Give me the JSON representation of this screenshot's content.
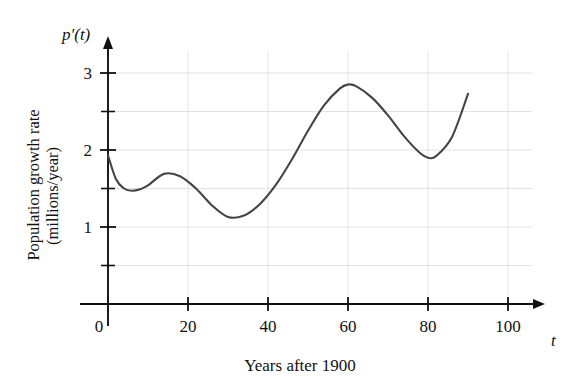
{
  "chart_data": {
    "type": "line",
    "title": "",
    "subtitle": "",
    "xlabel": "Years after 1900",
    "ylabel": "Population growth rate (millions/year)",
    "ylabel_line1": "Population growth rate",
    "ylabel_line2": "(millions/year)",
    "x_axis_symbol": "t",
    "y_axis_symbol": "p′(t)",
    "xlim": [
      0,
      108
    ],
    "ylim": [
      0,
      3.35
    ],
    "x_major_ticks": [
      0,
      20,
      40,
      60,
      80,
      100
    ],
    "x_tick_labels": [
      "0",
      "20",
      "40",
      "60",
      "80",
      "100"
    ],
    "y_major_ticks": [
      1,
      2,
      3
    ],
    "y_tick_labels": [
      "1",
      "2",
      "3"
    ],
    "y_minor_ticks": [
      0.5,
      1.5,
      2.5
    ],
    "grid": true,
    "grid_color": "#e2e2e6",
    "legend": "none",
    "line_color": "#444448",
    "axis_color": "#111111",
    "series": [
      {
        "name": "p'(t)",
        "x": [
          0,
          2,
          4,
          6,
          8,
          10,
          14,
          18,
          22,
          26,
          30,
          34,
          38,
          42,
          46,
          50,
          54,
          58,
          60,
          62,
          66,
          70,
          74,
          78,
          80,
          82,
          86,
          90
        ],
        "values": [
          1.93,
          1.62,
          1.5,
          1.47,
          1.49,
          1.54,
          1.69,
          1.66,
          1.5,
          1.28,
          1.13,
          1.15,
          1.3,
          1.55,
          1.88,
          2.25,
          2.58,
          2.8,
          2.85,
          2.83,
          2.68,
          2.45,
          2.18,
          1.96,
          1.9,
          1.92,
          2.17,
          2.73
        ]
      }
    ],
    "annotations": [
      {
        "label": "initial value at t=0",
        "x": 0,
        "y": 1.93
      },
      {
        "label": "local minimum",
        "x": 6,
        "y": 1.47
      },
      {
        "label": "local maximum",
        "x": 14,
        "y": 1.69
      },
      {
        "label": "global minimum",
        "x": 30,
        "y": 1.13
      },
      {
        "label": "global maximum",
        "x": 60,
        "y": 2.85
      },
      {
        "label": "local minimum",
        "x": 80,
        "y": 1.9
      },
      {
        "label": "end of curve",
        "x": 90,
        "y": 2.73
      }
    ]
  }
}
